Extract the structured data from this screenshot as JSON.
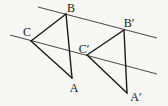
{
  "diagram": {
    "points": {
      "A": {
        "label": "A"
      },
      "B": {
        "label": "B"
      },
      "C": {
        "label": "C"
      },
      "A_prime": {
        "label": "A′"
      },
      "B_prime": {
        "label": "B′"
      },
      "C_prime": {
        "label": "C′"
      }
    },
    "parallel_lines": [
      {
        "name": "upper-parallel-line",
        "through": [
          "B",
          "B_prime"
        ]
      },
      {
        "name": "lower-parallel-line",
        "through": [
          "C",
          "C_prime"
        ]
      }
    ],
    "triangles": [
      {
        "name": "triangle-abc",
        "vertices": [
          "A",
          "B",
          "C"
        ]
      },
      {
        "name": "triangle-a-prime-b-prime-c-prime",
        "vertices": [
          "A_prime",
          "B_prime",
          "C_prime"
        ]
      }
    ],
    "colors": {
      "stroke": "#1a1a1a",
      "background": "#f7f7f5"
    }
  }
}
